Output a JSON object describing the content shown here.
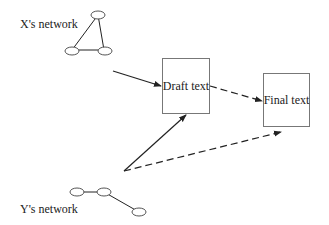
{
  "diagram": {
    "x_network": {
      "label": "X's network"
    },
    "y_network": {
      "label": "Y's network"
    },
    "draft_box": {
      "label": "Draft text"
    },
    "final_box": {
      "label": "Final text"
    },
    "colors": {
      "line": "#222222",
      "box_border": "#777777",
      "node_border": "#555555",
      "background": "#ffffff"
    },
    "edges": [
      {
        "from": "X's network",
        "to": "Draft text",
        "style": "solid"
      },
      {
        "from": "Y's network",
        "to": "Draft text",
        "style": "solid"
      },
      {
        "from": "Y's network",
        "to": "Final text",
        "style": "dashed"
      },
      {
        "from": "Draft text",
        "to": "Final text",
        "style": "dashed"
      }
    ]
  }
}
